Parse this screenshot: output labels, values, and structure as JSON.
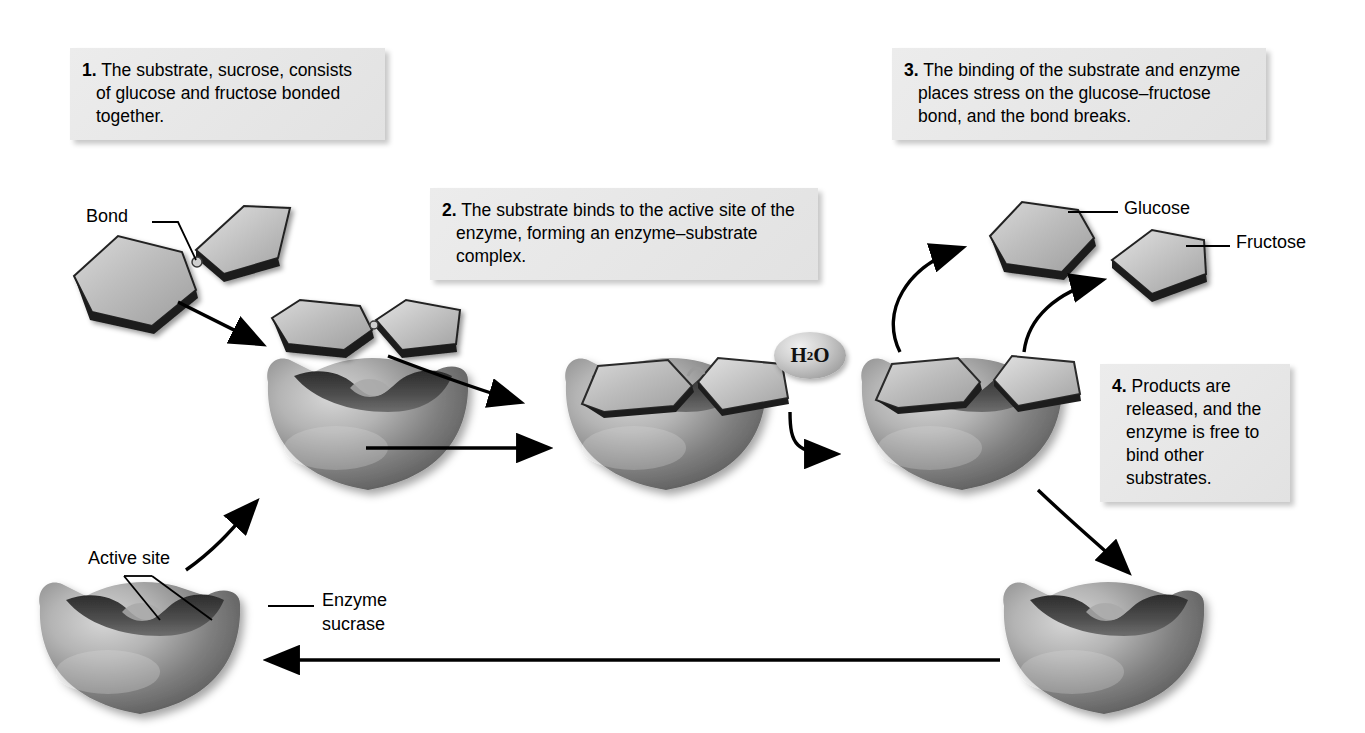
{
  "figure": {
    "background_color": "#ffffff",
    "ink_color": "#000000",
    "callout_bg": "#e9e9e9",
    "sugar_fill": "#b9b9b9",
    "enzyme_fill": "#9a9a9a"
  },
  "callouts": [
    {
      "id": "step-1",
      "number": "1.",
      "text": "The substrate, sucrose, consists of glucose and fructose bonded together.",
      "lines": [
        "The substrate, sucrose,",
        "consists of glucose and",
        "fructose bonded together."
      ]
    },
    {
      "id": "step-2",
      "number": "2.",
      "text": "The substrate binds to the active site of the enzyme, forming an enzyme–substrate complex.",
      "lines": [
        "The substrate binds to the active site",
        "of the enzyme, forming an enzyme–",
        "substrate complex."
      ]
    },
    {
      "id": "step-3",
      "number": "3.",
      "text": "The binding of the substrate and enzyme places stress on the glucose–fructose bond, and the bond breaks.",
      "lines": [
        "The binding of the substrate and",
        "enzyme places stress on the glucose–",
        "fructose bond, and the bond breaks."
      ]
    },
    {
      "id": "step-4",
      "number": "4.",
      "text": "Products are released, and the enzyme is free to bind other substrates.",
      "lines": [
        "Products are",
        "released, and",
        "the enzyme is",
        "free to bind other",
        "substrates."
      ]
    }
  ],
  "labels": {
    "bond": "Bond",
    "active_site": "Active site",
    "enzyme_sucrase_line1": "Enzyme",
    "enzyme_sucrase_line2": "sucrase",
    "glucose": "Glucose",
    "fructose": "Fructose",
    "water_formula": "H",
    "water_sub": "2",
    "water_formula_end": "O"
  },
  "molecules": [
    {
      "name": "glucose-hexagon-free",
      "shape": "hexagon",
      "stage": "free-substrate"
    },
    {
      "name": "fructose-pentagon-free",
      "shape": "pentagon",
      "stage": "free-substrate"
    },
    {
      "name": "glucose-hexagon-mid",
      "shape": "hexagon",
      "stage": "approaching"
    },
    {
      "name": "fructose-pentagon-mid",
      "shape": "pentagon",
      "stage": "approaching"
    },
    {
      "name": "glucose-hexagon-bound",
      "shape": "hexagon",
      "stage": "enzyme-substrate-complex"
    },
    {
      "name": "fructose-pentagon-bound",
      "shape": "pentagon",
      "stage": "enzyme-substrate-complex"
    },
    {
      "name": "glucose-hexagon-split",
      "shape": "hexagon",
      "stage": "bond-broken"
    },
    {
      "name": "fructose-pentagon-split",
      "shape": "pentagon",
      "stage": "bond-broken"
    },
    {
      "name": "glucose-product",
      "shape": "hexagon",
      "stage": "released-product"
    },
    {
      "name": "fructose-product",
      "shape": "pentagon",
      "stage": "released-product"
    }
  ],
  "enzymes": [
    {
      "name": "enzyme-free-bottom-left",
      "state": "free, empty active site"
    },
    {
      "name": "enzyme-empty-upper-left",
      "state": "free, empty active site"
    },
    {
      "name": "enzyme-substrate-complex",
      "state": "substrate bound"
    },
    {
      "name": "enzyme-products-bound",
      "state": "products bound, bond broken"
    },
    {
      "name": "enzyme-free-bottom-right",
      "state": "free again, products released"
    }
  ],
  "arrows": [
    {
      "name": "arrow-substrate-to-midpoint",
      "style": "curved"
    },
    {
      "name": "arrow-midpoint-to-active-site",
      "style": "curved"
    },
    {
      "name": "arrow-empty-enzyme-to-complex",
      "style": "straight"
    },
    {
      "name": "arrow-complex-to-split",
      "style": "curved"
    },
    {
      "name": "arrow-release-glucose",
      "style": "curved"
    },
    {
      "name": "arrow-release-fructose",
      "style": "curved"
    },
    {
      "name": "arrow-enzyme-recycles-down",
      "style": "curved"
    },
    {
      "name": "arrow-enzyme-returns-left",
      "style": "straight"
    },
    {
      "name": "arrow-free-enzyme-up",
      "style": "curved"
    }
  ]
}
